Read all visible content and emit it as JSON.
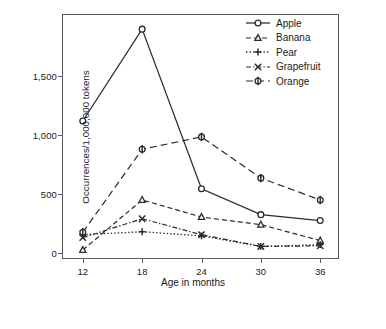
{
  "chart_data": {
    "type": "line",
    "title": "",
    "xlabel": "Age in months",
    "ylabel": "Occurrences/1,000,000 tokens",
    "categories": [
      "12",
      "18",
      "24",
      "30",
      "36"
    ],
    "x": [
      12,
      18,
      24,
      30,
      36
    ],
    "xlim": [
      10,
      38
    ],
    "ylim": [
      -60,
      2020
    ],
    "yticks": [
      0,
      500,
      1000,
      1500
    ],
    "ytick_labels": [
      "0",
      "500",
      "1,000",
      "1,500"
    ],
    "xtick_labels": [
      "12",
      "18",
      "24",
      "30",
      "36"
    ],
    "grid": false,
    "legend_position": "top-right",
    "series": [
      {
        "name": "Apple",
        "marker": "circle",
        "dash": "solid",
        "values": [
          1120,
          1900,
          545,
          325,
          275
        ]
      },
      {
        "name": "Banana",
        "marker": "triangle",
        "dash": "dashed",
        "values": [
          25,
          450,
          305,
          240,
          105
        ]
      },
      {
        "name": "Pear",
        "marker": "plus",
        "dash": "dotted",
        "values": [
          155,
          180,
          145,
          55,
          70
        ]
      },
      {
        "name": "Grapefruit",
        "marker": "cross",
        "dash": "dashdot",
        "values": [
          130,
          290,
          155,
          55,
          60
        ]
      },
      {
        "name": "Orange",
        "marker": "diamond",
        "dash": "longdash",
        "values": [
          175,
          880,
          985,
          635,
          450
        ]
      }
    ]
  },
  "legend": {
    "entries": [
      "Apple",
      "Banana",
      "Pear",
      "Grapefruit",
      "Orange"
    ]
  },
  "axes": {
    "y_label": "Occurrences/1,000,000 tokens",
    "x_label": "Age in months"
  },
  "colors": {
    "line": "#2b2b2b",
    "frame": "#5a5a5a",
    "background": "#ffffff"
  }
}
